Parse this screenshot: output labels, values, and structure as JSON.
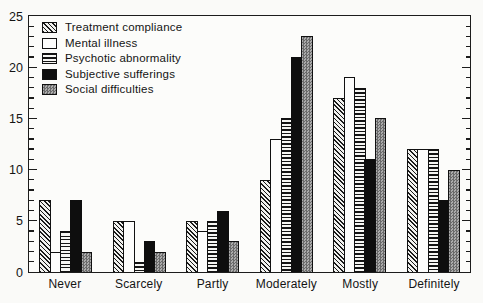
{
  "chart_data": {
    "type": "bar",
    "title": "",
    "xlabel": "",
    "ylabel": "",
    "categories": [
      "Never",
      "Scarcely",
      "Partly",
      "Moderately",
      "Mostly",
      "Definitely"
    ],
    "series": [
      {
        "name": "Treatment compliance",
        "pattern": "diagonal-hatch",
        "values": [
          7,
          5,
          5,
          9,
          17,
          12
        ]
      },
      {
        "name": "Mental illness",
        "pattern": "white",
        "values": [
          2,
          5,
          4,
          13,
          19,
          12
        ]
      },
      {
        "name": "Psychotic abnormality",
        "pattern": "horizontal-lines",
        "values": [
          4,
          1,
          5,
          15,
          18,
          12
        ]
      },
      {
        "name": "Subjective sufferings",
        "pattern": "solid-black",
        "values": [
          7,
          3,
          6,
          21,
          11,
          7
        ]
      },
      {
        "name": "Social difficulties",
        "pattern": "gray-dither",
        "values": [
          2,
          2,
          3,
          23,
          15,
          10
        ]
      }
    ],
    "ylim": [
      0,
      25
    ],
    "ytick_major_labels": [
      0,
      5,
      10,
      15,
      20,
      25
    ],
    "ytick_minor_step": 1,
    "grid": false,
    "legend_position": "top-left",
    "colors": {
      "ink": "#1c1c1c",
      "paper": "#fafaf8",
      "solid_fill": "#0e0e0e",
      "gray_fill": "#8f8f8f"
    }
  }
}
